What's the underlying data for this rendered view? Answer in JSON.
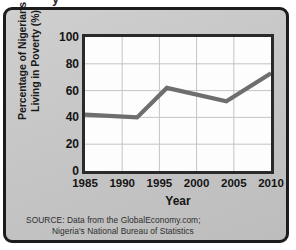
{
  "top_fragment": {
    "text": "y"
  },
  "chart_data": {
    "type": "line",
    "title": "",
    "xlabel": "Year",
    "ylabel": "Percentage of Nigerians Living in Poverty (%)",
    "ylabel_line1": "Percentage of Nigerians",
    "ylabel_line2": "Living in Poverty (%)",
    "xlim": [
      1985,
      2010
    ],
    "ylim": [
      0,
      100
    ],
    "xticks": [
      "1985",
      "1990",
      "1995",
      "2000",
      "2005",
      "2010"
    ],
    "xtick_values": [
      1985,
      1990,
      1995,
      2000,
      2005,
      2010
    ],
    "yticks": [
      "0",
      "20",
      "40",
      "60",
      "80",
      "100"
    ],
    "ytick_values": [
      0,
      20,
      40,
      60,
      80,
      100
    ],
    "grid": true,
    "legend": "none",
    "series": [
      {
        "name": "Percentage of Nigerians Living in Poverty",
        "color": "#6e6e6e",
        "x": [
          1985,
          1992,
          1996,
          2004,
          2010
        ],
        "y": [
          42,
          40,
          62,
          52,
          73
        ]
      }
    ]
  },
  "source": {
    "line1": "SOURCE: Data from the GlobalEconomy.com;",
    "line2": "Nigeria's National Bureau of Statistics"
  },
  "colors": {
    "card_background": "#c9c9c9",
    "card_border": "#1c1c1c",
    "plot_background": "#fdfdfd",
    "plot_border": "#2a2a2a",
    "grid": "#c4c4c4",
    "line": "#6e6e6e",
    "text": "#141414"
  }
}
